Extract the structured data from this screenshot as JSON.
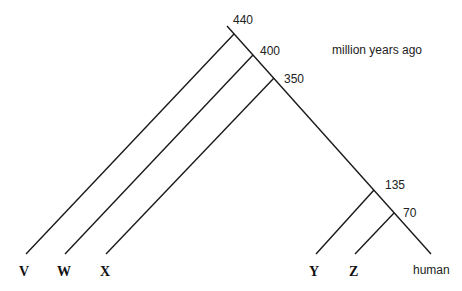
{
  "diagram": {
    "type": "phylogenetic-tree",
    "unit_label": "million years ago",
    "nodes": [
      {
        "id": "n440",
        "label": "440"
      },
      {
        "id": "n400",
        "label": "400"
      },
      {
        "id": "n350",
        "label": "350"
      },
      {
        "id": "n135",
        "label": "135"
      },
      {
        "id": "n70",
        "label": "70"
      }
    ],
    "leaves": [
      {
        "id": "V",
        "label": "V",
        "style": "bold-serif",
        "diverges_at": "440"
      },
      {
        "id": "W",
        "label": "W",
        "style": "bold-serif",
        "diverges_at": "400"
      },
      {
        "id": "X",
        "label": "X",
        "style": "bold-serif",
        "diverges_at": "350"
      },
      {
        "id": "Y",
        "label": "Y",
        "style": "bold-serif",
        "diverges_at": "135"
      },
      {
        "id": "Z",
        "label": "Z",
        "style": "bold-serif",
        "diverges_at": "70"
      },
      {
        "id": "human",
        "label": "human",
        "style": "plain",
        "diverges_at": "70"
      }
    ]
  }
}
